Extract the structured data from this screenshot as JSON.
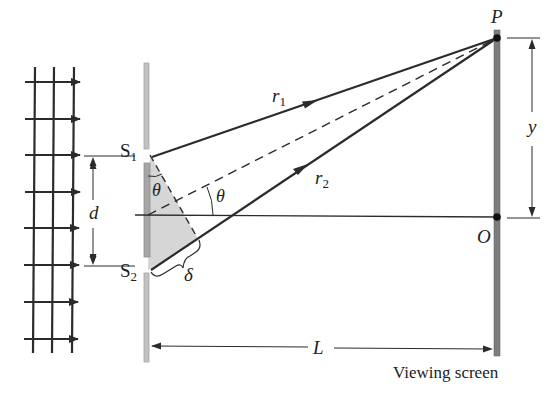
{
  "diagram": {
    "colors": {
      "line": "#2b2b2b",
      "barrier": "#b9b9b9",
      "barrier_inner": "#9a9a9a",
      "screen": "#7d7d7d",
      "shade": "#d6d6d6"
    },
    "labels": {
      "slit1": "S",
      "slit1_sub": "1",
      "slit2": "S",
      "slit2_sub": "2",
      "slit_separation": "d",
      "angle_at_slit": "θ",
      "angle_center": "θ",
      "path_difference": "δ",
      "ray1": "r",
      "ray1_sub": "1",
      "ray2": "r",
      "ray2_sub": "2",
      "point_p": "P",
      "point_o": "O",
      "height": "y",
      "distance": "L",
      "screen_caption": "Viewing screen"
    },
    "elements": [
      "incident plane waves (grid with arrows)",
      "barrier with two slits S1 and S2",
      "rays r1 and r2 converging to point P",
      "dashed center ray at angle θ",
      "viewing screen with points P and O"
    ]
  }
}
